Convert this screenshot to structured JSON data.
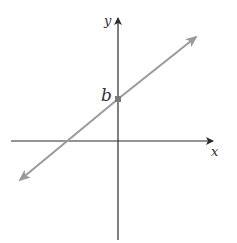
{
  "diagram": {
    "type": "coordinate-plane-line",
    "axes": {
      "x_label": "x",
      "y_label": "y",
      "color": "#2b2b2b"
    },
    "line": {
      "description": "line with positive slope and y-intercept b",
      "color": "#9a9a9a"
    },
    "intercept": {
      "label": "b",
      "point_color": "#7a7a7a"
    }
  }
}
